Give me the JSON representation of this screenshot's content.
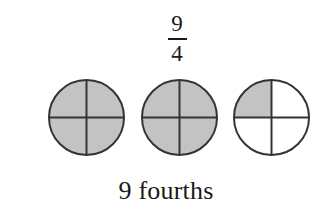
{
  "figure": {
    "name": "improper-fraction-circle-model",
    "background_color": "#ffffff",
    "fraction": {
      "numerator": "9",
      "denominator": "4",
      "bar_color": "#1a1a1a"
    },
    "caption": "9 fourths",
    "model": {
      "shape": "circle",
      "parts_per_whole": 4,
      "total_shaded_parts": 9,
      "whole_count": 3,
      "shaded_fill_color": "#c3c3c3",
      "unshaded_fill_color": "#ffffff",
      "outline_color": "#333333",
      "outline_width": 2,
      "divider_color": "#333333",
      "divider_width": 2,
      "circles": [
        {
          "label": "circle-1",
          "shaded_parts": 4,
          "quadrants": [
            {
              "name": "top-left",
              "shaded": true
            },
            {
              "name": "top-right",
              "shaded": true
            },
            {
              "name": "bottom-right",
              "shaded": true
            },
            {
              "name": "bottom-left",
              "shaded": true
            }
          ]
        },
        {
          "label": "circle-2",
          "shaded_parts": 4,
          "quadrants": [
            {
              "name": "top-left",
              "shaded": true
            },
            {
              "name": "top-right",
              "shaded": true
            },
            {
              "name": "bottom-right",
              "shaded": true
            },
            {
              "name": "bottom-left",
              "shaded": true
            }
          ]
        },
        {
          "label": "circle-3",
          "shaded_parts": 1,
          "quadrants": [
            {
              "name": "top-left",
              "shaded": true
            },
            {
              "name": "top-right",
              "shaded": false
            },
            {
              "name": "bottom-right",
              "shaded": false
            },
            {
              "name": "bottom-left",
              "shaded": false
            }
          ]
        }
      ]
    }
  }
}
